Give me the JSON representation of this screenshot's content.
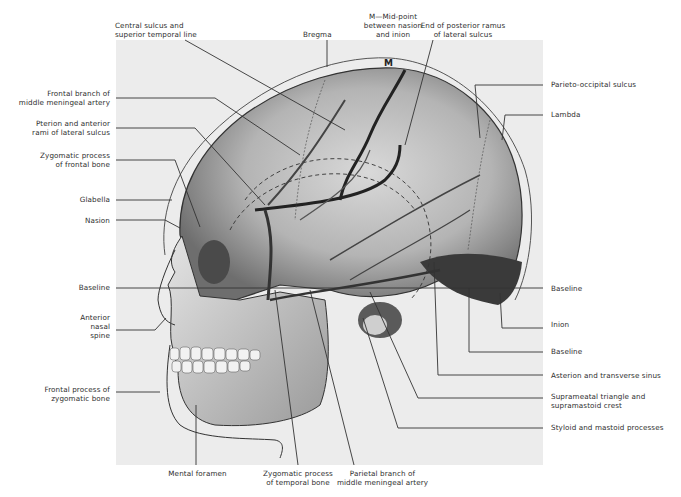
{
  "figure": {
    "marker_letter": "M"
  },
  "labels": {
    "top": [
      {
        "id": "central-sulcus",
        "text": [
          "Central sulcus and",
          "superior temporal line"
        ]
      },
      {
        "id": "bregma",
        "text": [
          "Bregma"
        ]
      },
      {
        "id": "midpoint-m",
        "text": [
          "M—Mid-point",
          "between nasion",
          "and inion"
        ]
      },
      {
        "id": "posterior-ramus-end",
        "text": [
          "End of posterior ramus",
          "of lateral sulcus"
        ]
      }
    ],
    "left": [
      {
        "id": "frontal-branch-mma",
        "text": [
          "Frontal branch of",
          "middle meningeal artery"
        ]
      },
      {
        "id": "pterion",
        "text": [
          "Pterion and anterior",
          "rami of lateral sulcus"
        ]
      },
      {
        "id": "zygomatic-process-frontal",
        "text": [
          "Zygomatic process",
          "of frontal bone"
        ]
      },
      {
        "id": "glabella",
        "text": [
          "Glabella"
        ]
      },
      {
        "id": "nasion",
        "text": [
          "Nasion"
        ]
      },
      {
        "id": "baseline-left",
        "text": [
          "Baseline"
        ]
      },
      {
        "id": "anterior-nasal-spine",
        "text": [
          "Anterior",
          "nasal",
          "spine"
        ]
      },
      {
        "id": "frontal-process-zygomatic",
        "text": [
          "Frontal process of",
          "zygomatic bone"
        ]
      }
    ],
    "right": [
      {
        "id": "parieto-occipital-sulcus",
        "text": [
          "Parieto-occipital sulcus"
        ]
      },
      {
        "id": "lambda",
        "text": [
          "Lambda"
        ]
      },
      {
        "id": "baseline-right-1",
        "text": [
          "Baseline"
        ]
      },
      {
        "id": "inion",
        "text": [
          "Inion"
        ]
      },
      {
        "id": "baseline-right-2",
        "text": [
          "Baseline"
        ]
      },
      {
        "id": "asterion",
        "text": [
          "Asterion and transverse sinus"
        ]
      },
      {
        "id": "suprameatal-triangle",
        "text": [
          "Suprameatal triangle  and",
          "supramastoid crest"
        ]
      },
      {
        "id": "styloid-mastoid",
        "text": [
          "Styloid and mastoid processes"
        ]
      }
    ],
    "bottom": [
      {
        "id": "mental-foramen",
        "text": [
          "Mental foramen"
        ]
      },
      {
        "id": "zygomatic-process-temporal",
        "text": [
          "Zygomatic process",
          "of temporal bone"
        ]
      },
      {
        "id": "parietal-branch-mma",
        "text": [
          "Parietal branch of",
          "middle meningeal artery"
        ]
      }
    ]
  }
}
